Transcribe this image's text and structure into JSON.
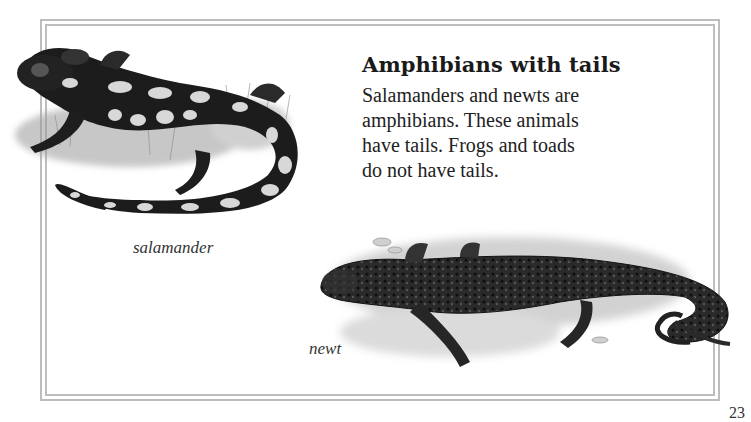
{
  "page": {
    "heading": "Amphibians with tails",
    "body_lines": [
      "Salamanders and newts are",
      "amphibians. These animals",
      "have tails. Frogs and toads",
      "do not have tails."
    ],
    "page_number": "23"
  },
  "illustrations": [
    {
      "id": "salamander",
      "caption": "salamander"
    },
    {
      "id": "newt",
      "caption": "newt"
    }
  ],
  "colors": {
    "frame": "#bdbdbd",
    "text": "#1a1a1a",
    "animal_dark": "#1c1c1c",
    "animal_spots": "#d8d8d8"
  }
}
